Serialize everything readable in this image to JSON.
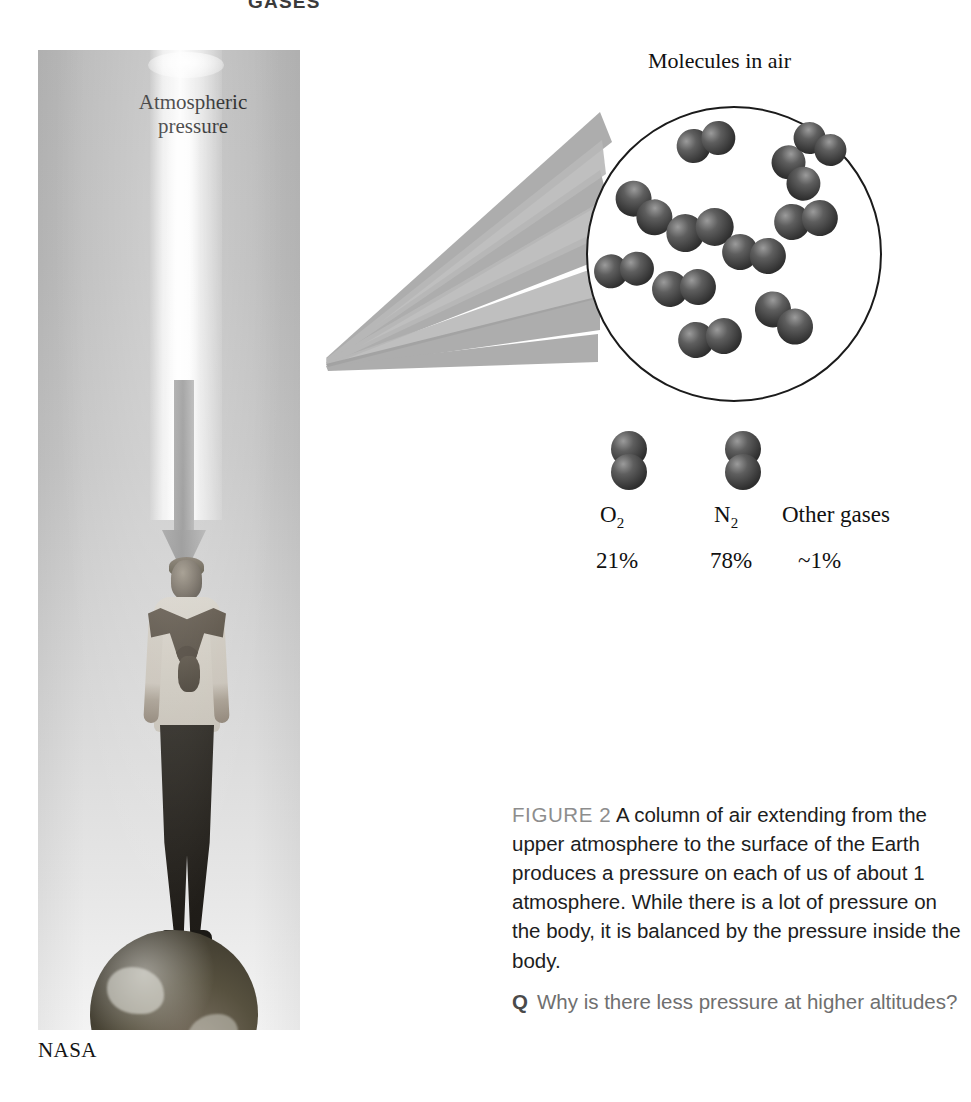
{
  "running_head": "GASES",
  "photo": {
    "alt_name": "person-standing-on-earth-photo",
    "column_label_line1": "Atmospheric",
    "column_label_line2": "pressure",
    "credit": "NASA"
  },
  "diagram": {
    "title": "Molecules in air",
    "circle_name": "molecule-magnifier-circle",
    "molecule_count": 11,
    "legend": [
      {
        "label": "O",
        "subscript": "2",
        "percent": "21%"
      },
      {
        "label": "N",
        "subscript": "2",
        "percent": "78%"
      },
      {
        "label": "Other gases",
        "subscript": "",
        "percent": "~1%"
      }
    ]
  },
  "caption": {
    "tag": "FIGURE 2",
    "text": "A column of air extending from the upper atmosphere to the surface of the Earth produces a pressure on each of us of about 1 atmosphere. While there is a lot of pressure on the body, it is balanced by the pressure inside the body."
  },
  "question": {
    "marker": "Q",
    "text": "Why is there less pressure at higher altitudes?"
  },
  "colors": {
    "ink": "#111111",
    "caption_tag_gray": "#8d8d8d",
    "question_gray": "#6f6f6f",
    "molecule_dark": "#3f3f3f",
    "arrow_gray": "#9a9a9a"
  }
}
